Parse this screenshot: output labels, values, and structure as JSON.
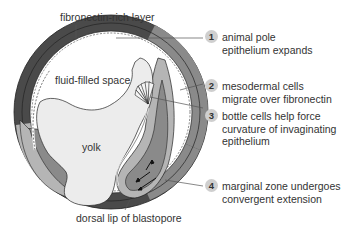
{
  "labels": {
    "top": "fibronectin-rich layer",
    "cavity": "fluid-filled space",
    "yolk": "yolk",
    "bottom": "dorsal lip of blastopore"
  },
  "steps": [
    {
      "num": "1",
      "text": "animal pole\nepithelium expands"
    },
    {
      "num": "2",
      "text": "mesodermal cells\nmigrate over fibronectin"
    },
    {
      "num": "3",
      "text": "bottle cells help force\ncurvature of invaginating\nepithelium"
    },
    {
      "num": "4",
      "text": "marginal zone undergoes\nconvergent extension"
    }
  ],
  "colors": {
    "outer_dark": "#4a4a4a",
    "mid_gray": "#8a8a8a",
    "light_gray": "#b5b5b5",
    "yolk": "#ececec",
    "callout_badge": "#cfcfcf",
    "leader_line": "#555555"
  }
}
